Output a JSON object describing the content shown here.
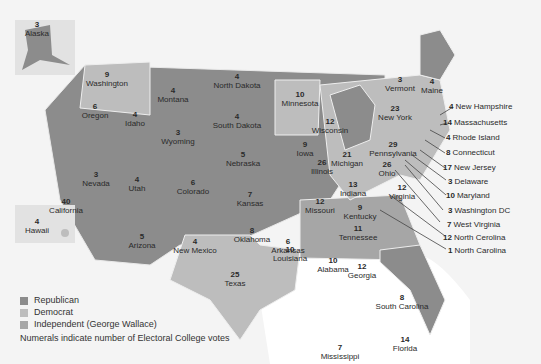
{
  "colors": {
    "republican": "#8c8c8c",
    "democrat": "#bdbdbd",
    "independent": "#a6a6a6",
    "background": "#f4f4f4",
    "water": "#ffffff"
  },
  "legend": [
    {
      "label": "Republican",
      "color": "#8c8c8c"
    },
    {
      "label": "Democrat",
      "color": "#bdbdbd"
    },
    {
      "label": "Independent (George Wallace)",
      "color": "#a6a6a6"
    }
  ],
  "note": "Numerals indicate number of Electoral College votes",
  "states": [
    {
      "name": "Alaska",
      "votes": "3"
    },
    {
      "name": "Hawaii",
      "votes": "4"
    },
    {
      "name": "Washington",
      "votes": "9"
    },
    {
      "name": "Oregon",
      "votes": "6"
    },
    {
      "name": "California",
      "votes": "40"
    },
    {
      "name": "Idaho",
      "votes": "4"
    },
    {
      "name": "Nevada",
      "votes": "3"
    },
    {
      "name": "Montana",
      "votes": "4"
    },
    {
      "name": "Wyoming",
      "votes": "3"
    },
    {
      "name": "Utah",
      "votes": "4"
    },
    {
      "name": "Arizona",
      "votes": "5"
    },
    {
      "name": "Colorado",
      "votes": "6"
    },
    {
      "name": "New Mexico",
      "votes": "4"
    },
    {
      "name": "North Dakota",
      "votes": "4"
    },
    {
      "name": "South Dakota",
      "votes": "4"
    },
    {
      "name": "Nebraska",
      "votes": "5"
    },
    {
      "name": "Kansas",
      "votes": "7"
    },
    {
      "name": "Oklahoma",
      "votes": "8"
    },
    {
      "name": "Texas",
      "votes": "25"
    },
    {
      "name": "Minnesota",
      "votes": "10"
    },
    {
      "name": "Iowa",
      "votes": "9"
    },
    {
      "name": "Missouri",
      "votes": "12"
    },
    {
      "name": "Arkansas",
      "votes": "6"
    },
    {
      "name": "Louisiana",
      "votes": "10"
    },
    {
      "name": "Wisconsin",
      "votes": "12"
    },
    {
      "name": "Illinois",
      "votes": "26"
    },
    {
      "name": "Michigan",
      "votes": "21"
    },
    {
      "name": "Indiana",
      "votes": "13"
    },
    {
      "name": "Ohio",
      "votes": "26"
    },
    {
      "name": "Kentucky",
      "votes": "9"
    },
    {
      "name": "Tennessee",
      "votes": "11"
    },
    {
      "name": "Mississippi",
      "votes": "7"
    },
    {
      "name": "Alabama",
      "votes": "10"
    },
    {
      "name": "Georgia",
      "votes": "12"
    },
    {
      "name": "Florida",
      "votes": "14"
    },
    {
      "name": "South Carolina",
      "votes": "8"
    },
    {
      "name": "Virginia",
      "votes": "12"
    },
    {
      "name": "Pennsylvania",
      "votes": "29"
    },
    {
      "name": "New York",
      "votes": "23"
    },
    {
      "name": "Vermont",
      "votes": "3"
    },
    {
      "name": "Maine",
      "votes": "4"
    }
  ],
  "callouts": [
    {
      "votes": "4",
      "name": "New Hampshire"
    },
    {
      "votes": "14",
      "name": "Massachusetts"
    },
    {
      "votes": "4",
      "name": "Rhode Island"
    },
    {
      "votes": "8",
      "name": "Connecticut"
    },
    {
      "votes": "17",
      "name": "New Jersey"
    },
    {
      "votes": "3",
      "name": "Delaware"
    },
    {
      "votes": "10",
      "name": "Maryland"
    },
    {
      "votes": "3",
      "name": "Washington DC"
    },
    {
      "votes": "7",
      "name": "West Virginia"
    },
    {
      "votes": "12",
      "name": "North Cerolina"
    },
    {
      "votes": "1",
      "name": "North Carolina"
    }
  ]
}
